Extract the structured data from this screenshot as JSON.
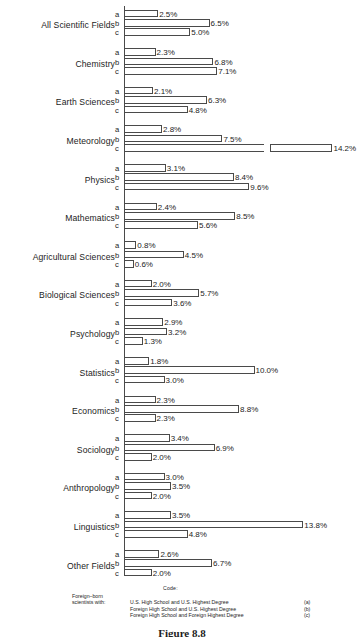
{
  "chart_data": {
    "type": "bar",
    "orientation": "horizontal",
    "title": "",
    "xlabel": "",
    "ylabel": "",
    "xlim": [
      0,
      14.5
    ],
    "grid": false,
    "axis_break": true,
    "value_suffix": "%",
    "series_codes": [
      "a",
      "b",
      "c"
    ],
    "series": [
      {
        "name": "a",
        "label": "U.S. High School and U.S. Highest Degree"
      },
      {
        "name": "b",
        "label": "Foreign High School and U.S. Highest Degree"
      },
      {
        "name": "c",
        "label": "Foreign High School and Foreign Highest Degree"
      }
    ],
    "categories": [
      "All Scientific Fields",
      "Chemistry",
      "Earth Sciences",
      "Meteorology",
      "Physics",
      "Mathematics",
      "Agricultural Sciences",
      "Biological Sciences",
      "Psychology",
      "Statistics",
      "Economics",
      "Sociology",
      "Anthropology",
      "Linguistics",
      "Other Fields"
    ],
    "values": {
      "a": [
        2.5,
        2.3,
        2.1,
        2.8,
        3.1,
        2.4,
        0.8,
        2.0,
        2.9,
        1.8,
        2.3,
        3.4,
        3.0,
        3.5,
        2.6
      ],
      "b": [
        6.5,
        6.8,
        6.3,
        7.5,
        8.4,
        8.5,
        4.5,
        5.7,
        3.2,
        10.0,
        8.8,
        6.9,
        3.5,
        13.8,
        6.7
      ],
      "c": [
        5.0,
        7.1,
        4.8,
        14.2,
        9.6,
        5.6,
        0.6,
        3.6,
        1.3,
        3.0,
        2.3,
        2.0,
        2.0,
        4.8,
        2.0
      ]
    },
    "labels": {
      "a": [
        "2.5%",
        "2.3%",
        "2.1%",
        "2.8%",
        "3.1%",
        "2.4%",
        "0.8%",
        "2.0%",
        "2.9%",
        "1.8%",
        "2.3%",
        "3.4%",
        "3.0%",
        "3.5%",
        "2.6%"
      ],
      "b": [
        "6.5%",
        "6.8%",
        "6.3%",
        "7.5%",
        "8.4%",
        "8.5%",
        "4.5%",
        "5.7%",
        "3.2%",
        "10.0%",
        "8.8%",
        "6.9%",
        "3.5%",
        "13.8%",
        "6.7%"
      ],
      "c": [
        "5.0%",
        "7.1%",
        "4.8%",
        "14.2%",
        "9.6%",
        "5.6%",
        "0.6%",
        "3.6%",
        "1.3%",
        "3.0%",
        "2.3%",
        "2.0%",
        "2.0%",
        "4.8%",
        "2.0%"
      ]
    },
    "broken_bars": [
      {
        "category": "Meteorology",
        "code": "c",
        "value": 14.2
      }
    ]
  },
  "legend": {
    "title": "Code:",
    "who_line1": "Foreign–born",
    "who_line2": "scientists with:",
    "entries": [
      {
        "text": "U.S. High School and U.S. Highest Degree",
        "key": "(a)"
      },
      {
        "text": "Foreign High School and U.S. Highest Degree",
        "key": "(b)"
      },
      {
        "text": "Foreign High School and Foreign Highest Degree",
        "key": "(c)"
      }
    ]
  },
  "caption": "Figure 8.8"
}
